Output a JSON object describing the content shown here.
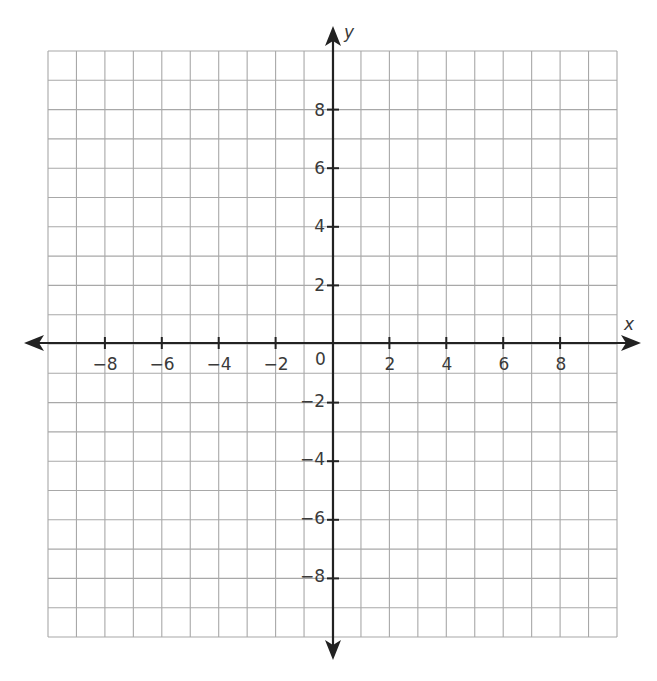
{
  "chart_data": {
    "type": "scatter",
    "title": "",
    "subtitle": "",
    "xlabel": "x",
    "ylabel": "y",
    "xlim": [
      -10,
      10
    ],
    "ylim": [
      -10,
      10
    ],
    "grid": true,
    "grid_step": 1,
    "x_ticks": [
      -8,
      -6,
      -4,
      -2,
      2,
      4,
      6,
      8
    ],
    "x_tick_labels": [
      "−8",
      "−6",
      "−4",
      "−2",
      "2",
      "4",
      "6",
      "8"
    ],
    "y_ticks": [
      8,
      6,
      4,
      2,
      -2,
      -4,
      -6,
      -8
    ],
    "y_tick_labels": [
      "8",
      "6",
      "4",
      "2",
      "−2",
      "−4",
      "−6",
      "−8"
    ],
    "origin_label": "0",
    "series": [],
    "legend": null
  },
  "colors": {
    "grid": "#a8a8a8",
    "axis": "#222222",
    "text": "#3a3a3a",
    "background": "#ffffff"
  },
  "labels": {
    "x_axis": "x",
    "y_axis": "y",
    "origin": "0",
    "x_ticks": [
      "−8",
      "−6",
      "−4",
      "−2",
      "2",
      "4",
      "6",
      "8"
    ],
    "y_ticks": [
      "8",
      "6",
      "4",
      "2",
      "−2",
      "−4",
      "−6",
      "−8"
    ]
  }
}
